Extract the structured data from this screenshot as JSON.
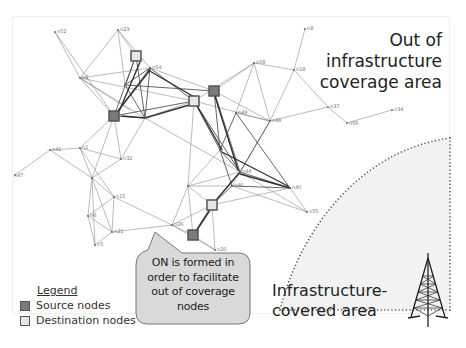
{
  "diagram": {
    "regions": {
      "out_of_coverage": {
        "label_lines": [
          "Out of",
          "infrastructure",
          "coverage area"
        ]
      },
      "covered": {
        "label_lines": [
          "Infrastructure-",
          "covered area"
        ],
        "fill": "#f2f2f2",
        "border": "dotted"
      }
    },
    "callout": {
      "lines": [
        "ON is formed in",
        "order to facilitate",
        "out of coverage",
        "nodes"
      ],
      "fill": "#d9d9d9"
    },
    "legend": {
      "title": "Legend",
      "items": [
        {
          "label": "Source nodes",
          "swatch": "#7a7a7a"
        },
        {
          "label": "Destination nodes",
          "swatch": "#e6e6e6"
        }
      ]
    },
    "tower_icon": "cell-tower-icon",
    "source_nodes": [
      {
        "x": 114,
        "y": 116
      },
      {
        "x": 214,
        "y": 91
      },
      {
        "x": 193,
        "y": 235
      }
    ],
    "destination_nodes": [
      {
        "x": 136,
        "y": 56
      },
      {
        "x": 194,
        "y": 101
      },
      {
        "x": 212,
        "y": 205
      }
    ],
    "node_labels": [
      {
        "text": "n52",
        "x": 55,
        "y": 32
      },
      {
        "text": "n23",
        "x": 118,
        "y": 30
      },
      {
        "text": "n2",
        "x": 82,
        "y": 77
      },
      {
        "text": "n54",
        "x": 150,
        "y": 68
      },
      {
        "text": "n58",
        "x": 254,
        "y": 63
      },
      {
        "text": "n8",
        "x": 305,
        "y": 29
      },
      {
        "text": "n18",
        "x": 294,
        "y": 70
      },
      {
        "text": "n37",
        "x": 328,
        "y": 107
      },
      {
        "text": "n34",
        "x": 392,
        "y": 110
      },
      {
        "text": "n56",
        "x": 347,
        "y": 123
      },
      {
        "text": "n48",
        "x": 270,
        "y": 121
      },
      {
        "text": "n49",
        "x": 236,
        "y": 113
      },
      {
        "text": "n41",
        "x": 50,
        "y": 150
      },
      {
        "text": "n47",
        "x": 15,
        "y": 175
      },
      {
        "text": "n1",
        "x": 80,
        "y": 148
      },
      {
        "text": "n32",
        "x": 121,
        "y": 159
      },
      {
        "text": "n15",
        "x": 114,
        "y": 197
      },
      {
        "text": "n6",
        "x": 88,
        "y": 216
      },
      {
        "text": "n21",
        "x": 112,
        "y": 232
      },
      {
        "text": "n5",
        "x": 95,
        "y": 245
      },
      {
        "text": "n44",
        "x": 240,
        "y": 172
      },
      {
        "text": "n46",
        "x": 232,
        "y": 186
      },
      {
        "text": "n40",
        "x": 291,
        "y": 188
      },
      {
        "text": "n55",
        "x": 307,
        "y": 212
      },
      {
        "text": "n26",
        "x": 177,
        "y": 225
      },
      {
        "text": "n20",
        "x": 221,
        "y": 250
      }
    ]
  }
}
